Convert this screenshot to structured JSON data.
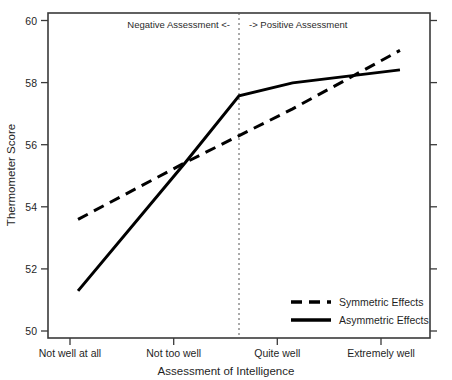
{
  "chart_data": {
    "type": "line",
    "title": "",
    "xlabel": "Assessment of Intelligence",
    "ylabel": "Thermometer Score",
    "categories": [
      "Not well at all",
      "Not too well",
      "Quite well",
      "Extremely well"
    ],
    "x": [
      1,
      2,
      3,
      4
    ],
    "xlim": [
      0.72,
      4.28
    ],
    "ylim": [
      50,
      60
    ],
    "yticks": [
      50,
      52,
      54,
      56,
      58,
      60
    ],
    "ytick_labels": [
      "50",
      "52",
      "54",
      "56",
      "58",
      "60"
    ],
    "grid": false,
    "legend_position": "bottom-right",
    "series": [
      {
        "name": "Symmetric Effects",
        "style": "dashed",
        "color": "#000000",
        "values": [
          53.65,
          55.4,
          57.05,
          58.85
        ]
      },
      {
        "name": "Asymmetric Effects",
        "style": "solid",
        "color": "#000000",
        "values": [
          51.45,
          55.4,
          57.85,
          58.25
        ],
        "kink": {
          "x": 2.5,
          "y": 57.45
        }
      }
    ],
    "annotations": [
      {
        "name": "negative-assessment-label",
        "text": "Negative Assessment <-",
        "x": 1.78,
        "y": 59.72,
        "anchor": "end"
      },
      {
        "name": "positive-assessment-label",
        "text": "-> Positive Assessment",
        "x": 2.63,
        "y": 59.72,
        "anchor": "start"
      }
    ],
    "reference_line": {
      "name": "midpoint-divider",
      "x": 2.5,
      "style": "dotted"
    }
  },
  "legend": {
    "entries": [
      {
        "label": "Symmetric Effects",
        "style": "dashed"
      },
      {
        "label": "Asymmetric Effects",
        "style": "solid"
      }
    ]
  }
}
